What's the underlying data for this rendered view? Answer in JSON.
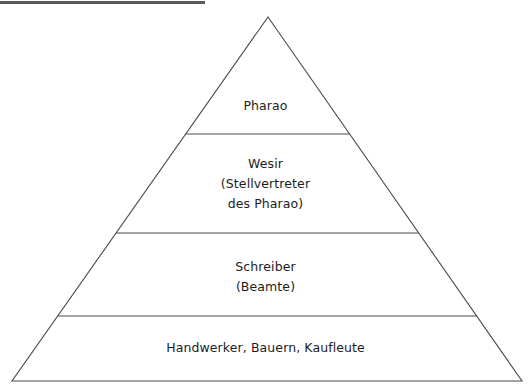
{
  "diagram": {
    "type": "pyramid-hierarchy",
    "title_rule": "",
    "background_color": "#ffffff",
    "stroke_color": "#4a4a4a",
    "text_color": "#1c1c1c",
    "rule_color": "#5a5a5a",
    "apex": {
      "x": 268,
      "y": 17
    },
    "base_left": {
      "x": 12,
      "y": 381
    },
    "base_right": {
      "x": 522,
      "y": 381
    },
    "divider_y": [
      134,
      233,
      316
    ],
    "tiers": [
      {
        "rank": 1,
        "name": "pharao",
        "lines": [
          "Pharao"
        ]
      },
      {
        "rank": 2,
        "name": "wesir",
        "lines": [
          "Wesir",
          "(Stellvertreter",
          "des Pharao)"
        ]
      },
      {
        "rank": 3,
        "name": "schreiber",
        "lines": [
          "Schreiber",
          "(Beamte)"
        ]
      },
      {
        "rank": 4,
        "name": "handwerker-bauern-kaufleute",
        "lines": [
          "Handwerker, Bauern, Kaufleute"
        ]
      }
    ]
  }
}
